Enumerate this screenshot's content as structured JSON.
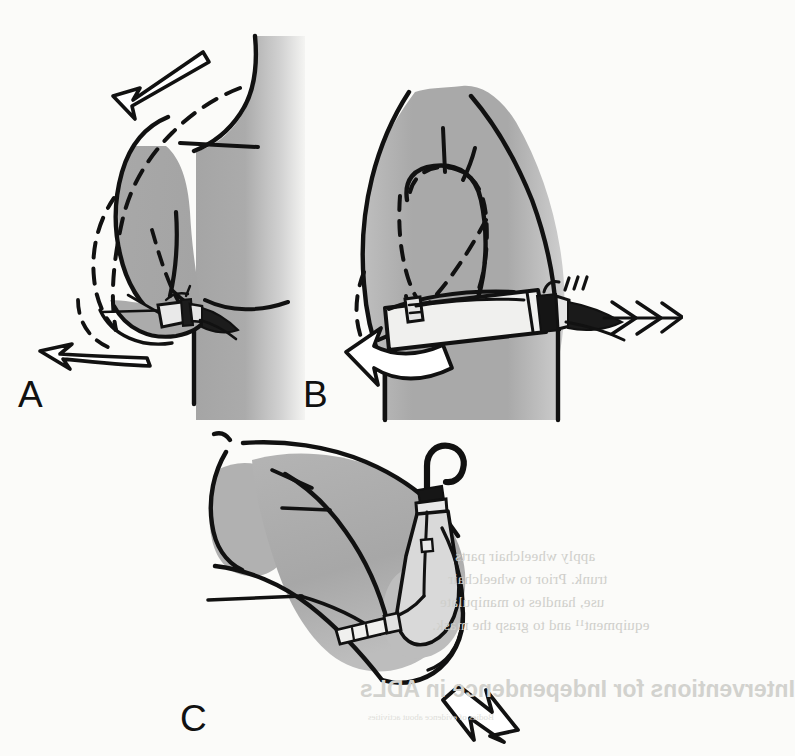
{
  "figure": {
    "caption_labels": {
      "a": "A",
      "b": "B",
      "c": "C"
    },
    "panels": [
      {
        "id": "A",
        "label": "A",
        "view": "lateral view of shoulder and upper arm",
        "description": "Scapular abduction and chest expansion control motion; dashed line shows alternate limb position",
        "motion_arrows": [
          {
            "name": "shoulder-depression-arrow",
            "direction": "down-left",
            "style": "straight-open-outline"
          },
          {
            "name": "elbow-extension-arrow",
            "direction": "left",
            "style": "curved-open-outline"
          }
        ],
        "device": "prosthetic-hook-terminal-device"
      },
      {
        "id": "B",
        "label": "B",
        "view": "anterior view of trunk and shoulder",
        "description": "Humeral flexion and shoulder control motion operating the terminal device",
        "motion_arrows": [
          {
            "name": "terminal-device-opening-arrow",
            "direction": "right",
            "style": "chevron-trio"
          },
          {
            "name": "humeral-rotation-arrow",
            "direction": "left",
            "style": "thick-white-curved"
          }
        ],
        "device": "prosthetic-hook-terminal-device"
      },
      {
        "id": "C",
        "label": "C",
        "view": "oblique view of forearm extended forward",
        "description": "Elbow extension with suspended hook terminal device and control cable",
        "motion_arrows": [
          {
            "name": "forward-reach-arrow",
            "direction": "down-right",
            "style": "open-outline"
          }
        ],
        "device": "suspended-hook-with-control-cable"
      }
    ],
    "colors": {
      "paper": "#fbfbf9",
      "ink": "#111111",
      "limb_fill": "#a9a9a9",
      "limb_fill_light": "#c8c8c8",
      "device_dark": "#1a1a1a",
      "bleed_text": "#cfcfcb"
    }
  },
  "bleedthrough": {
    "note": "faint mirrored text showing through from the reverse side of the page",
    "lines": [
      "apply wheelchair parts",
      "trunk.  Prior to wheelchair",
      "use, handles to manipulate",
      "equipment¹¹ and to grasp the mask."
    ],
    "heading": "Interventions for Independence in ADLs",
    "subline": "Bodies of evidence about activities"
  }
}
